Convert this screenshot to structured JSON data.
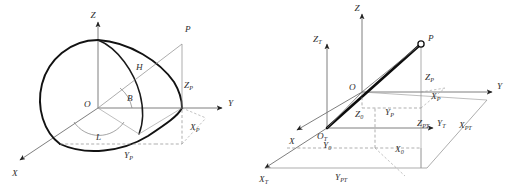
{
  "figure": {
    "background_color": "#ffffff",
    "panel_count": 2
  },
  "panels": [
    {
      "id": "left",
      "name": "geodetic-ellipsoid-panel",
      "description": "Quarter ellipsoid showing geodetic coordinates L, B, H of point P relative to geocentric frame O-XYZ",
      "axes": [
        {
          "name": "z-axis",
          "label": "Z",
          "direction": "up"
        },
        {
          "name": "y-axis",
          "label": "Y",
          "direction": "right"
        },
        {
          "name": "x-axis",
          "label": "X",
          "direction": "down-left"
        }
      ],
      "origin_label": "O",
      "point_label": "P",
      "angles": [
        {
          "name": "latitude-angle",
          "label": "B"
        },
        {
          "name": "longitude-angle",
          "label": "L"
        }
      ],
      "measures": [
        {
          "name": "ellipsoidal-height",
          "label": "H"
        }
      ],
      "projections": [
        {
          "name": "z-projection",
          "label": "Z",
          "sub": "P"
        },
        {
          "name": "x-projection",
          "label": "X",
          "sub": "P"
        },
        {
          "name": "y-projection",
          "label": "Y",
          "sub": "P"
        }
      ]
    },
    {
      "id": "right",
      "name": "topocentric-transform-panel",
      "description": "Two coordinate frames O-XYZ and O_T-X_T Y_T Z_T with point P and its projections",
      "axes": [
        {
          "name": "z-axis",
          "label": "Z",
          "direction": "up"
        },
        {
          "name": "y-axis",
          "label": "Y",
          "direction": "right"
        },
        {
          "name": "x-axis",
          "label": "X",
          "direction": "down-left"
        },
        {
          "name": "zt-axis",
          "label": "Z",
          "sub": "T",
          "direction": "up"
        },
        {
          "name": "yt-axis",
          "label": "Y",
          "sub": "T",
          "direction": "right"
        },
        {
          "name": "xt-axis",
          "label": "X",
          "sub": "T",
          "direction": "down-left"
        }
      ],
      "origins": [
        {
          "name": "origin-o",
          "label": "O"
        },
        {
          "name": "origin-ot",
          "label": "O",
          "sub": "T"
        }
      ],
      "point_label": "P",
      "projections": [
        {
          "name": "zp-projection",
          "label": "Z",
          "sub": "P"
        },
        {
          "name": "xp-projection",
          "label": "X",
          "sub": "P"
        },
        {
          "name": "yp-projection",
          "label": "Y",
          "sub": "P"
        },
        {
          "name": "zpt-projection",
          "label": "Z",
          "sub": "PT"
        },
        {
          "name": "xpt-projection",
          "label": "X",
          "sub": "PT"
        },
        {
          "name": "ypt-projection",
          "label": "Y",
          "sub": "PT"
        },
        {
          "name": "z0-offset",
          "label": "Z",
          "sub": "0"
        },
        {
          "name": "x0-offset",
          "label": "X",
          "sub": "0"
        },
        {
          "name": "y0-offset",
          "label": "Y",
          "sub": "0"
        }
      ]
    }
  ],
  "labels": {
    "left": {
      "Z": "Z",
      "Y": "Y",
      "X": "X",
      "O": "O",
      "P": "P",
      "H": "H",
      "B": "B",
      "L": "L",
      "Zp_base": "Z",
      "Zp_sub": "P",
      "Xp_base": "X",
      "Xp_sub": "P",
      "Yp_base": "Y",
      "Yp_sub": "P"
    },
    "right": {
      "Z": "Z",
      "Y": "Y",
      "X": "X",
      "O": "O",
      "P": "P",
      "Zt_base": "Z",
      "Zt_sub": "T",
      "Yt_base": "Y",
      "Yt_sub": "T",
      "Xt_base": "X",
      "Xt_sub": "T",
      "Ot_base": "O",
      "Ot_sub": "T",
      "Zp_base": "Z",
      "Zp_sub": "P",
      "Xp_base": "X",
      "Xp_sub": "P",
      "Yp_base": "Y",
      "Yp_sub": "P",
      "Zpt_base": "Z",
      "Zpt_sub": "PT",
      "Xpt_base": "X",
      "Xpt_sub": "PT",
      "Ypt_base": "Y",
      "Ypt_sub": "PT",
      "Z0_base": "Z",
      "Z0_sub": "0",
      "X0_base": "X",
      "X0_sub": "0",
      "Y0_base": "Y",
      "Y0_sub": "0"
    }
  },
  "colors": {
    "background": "#ffffff",
    "ellipsoid_curve": "#121212",
    "axis": "#6f6f6f",
    "dashed": "#8d8d8d",
    "vector_bold": "#0d0d0d",
    "label_text": "#2e2e2e"
  }
}
